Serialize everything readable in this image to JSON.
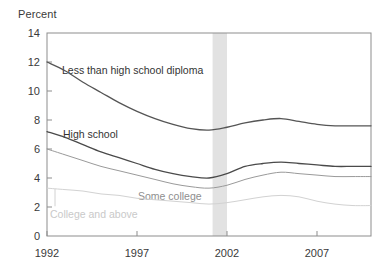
{
  "chart_data": {
    "type": "line",
    "title": "",
    "ylabel": "Percent",
    "xlabel": "",
    "ylim": [
      0,
      14
    ],
    "xlim": [
      1992,
      2010
    ],
    "grid": false,
    "legend_position": "inline-annotations",
    "y_ticks": [
      14,
      12,
      10,
      8,
      6,
      4,
      2,
      0
    ],
    "x_ticks": [
      1992,
      1997,
      2002,
      2007
    ],
    "x": [
      1992,
      1993,
      1994,
      1995,
      1996,
      1997,
      1998,
      1999,
      2000,
      2001,
      2002,
      2003,
      2004,
      2005,
      2006,
      2007,
      2008,
      2009,
      2010
    ],
    "shaded_bands": [
      {
        "label": "recession",
        "start": 2001.2,
        "end": 2002.0,
        "color": "#e2e2e2"
      }
    ],
    "series": [
      {
        "name": "Less than high school diploma",
        "color": "#555555",
        "label_x": 1993.5,
        "label_y": 11.1,
        "values": [
          12.0,
          11.4,
          10.6,
          9.9,
          9.2,
          8.6,
          8.1,
          7.7,
          7.4,
          7.3,
          7.5,
          7.8,
          8.0,
          8.1,
          7.9,
          7.7,
          7.6,
          7.6,
          7.6
        ]
      },
      {
        "name": "High school",
        "color": "#4a4a4a",
        "label_x": 1993.6,
        "label_y": 7.4,
        "values": [
          7.2,
          6.8,
          6.3,
          5.8,
          5.4,
          5.0,
          4.6,
          4.3,
          4.1,
          4.0,
          4.3,
          4.8,
          5.0,
          5.1,
          5.0,
          4.9,
          4.8,
          4.8,
          4.8
        ]
      },
      {
        "name": "Some college",
        "color": "#9a9a9a",
        "label_x": 1998.2,
        "label_y": 3.0,
        "values": [
          6.0,
          5.6,
          5.2,
          4.8,
          4.5,
          4.2,
          3.9,
          3.6,
          3.4,
          3.3,
          3.5,
          3.9,
          4.2,
          4.4,
          4.3,
          4.2,
          4.1,
          4.1,
          4.1
        ]
      },
      {
        "name": "College and above",
        "color": "#d2d2d2",
        "label_x": 1992.6,
        "label_y": 1.8,
        "values": [
          3.3,
          3.2,
          3.1,
          2.9,
          2.8,
          2.6,
          2.5,
          2.4,
          2.3,
          2.2,
          2.3,
          2.5,
          2.7,
          2.8,
          2.7,
          2.4,
          2.2,
          2.1,
          2.1
        ]
      }
    ]
  },
  "axis": {
    "y_title": "Percent",
    "y_labels": [
      "14",
      "12",
      "10",
      "8",
      "6",
      "4",
      "2",
      "0"
    ],
    "x_labels": [
      "1992",
      "1997",
      "2002",
      "2007"
    ]
  },
  "annotations": {
    "less_than_hs": "Less than high school diploma",
    "high_school": "High school",
    "some_college": "Some college",
    "college_above": "College and above"
  }
}
